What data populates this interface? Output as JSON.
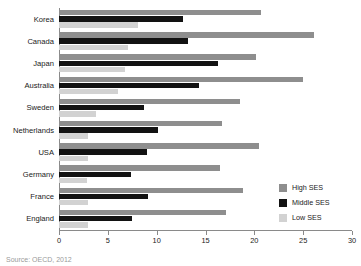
{
  "chart_data": {
    "type": "bar",
    "orientation": "horizontal",
    "title": "",
    "xlabel": "",
    "ylabel": "",
    "xlim": [
      0,
      30
    ],
    "xticks": [
      0,
      5,
      10,
      15,
      20,
      25,
      30
    ],
    "grid": false,
    "legend_position": "right",
    "categories": [
      "Korea",
      "Canada",
      "Japan",
      "Australia",
      "Sweden",
      "Netherlands",
      "USA",
      "Germany",
      "France",
      "England"
    ],
    "series": [
      {
        "name": "High SES",
        "color": "#8e8e8e",
        "values": [
          20.7,
          26.1,
          20.2,
          25.0,
          18.5,
          16.7,
          20.5,
          16.5,
          18.8,
          17.1
        ]
      },
      {
        "name": "Middle SES",
        "color": "#121212",
        "values": [
          12.7,
          13.2,
          16.3,
          14.3,
          8.7,
          10.1,
          9.0,
          7.4,
          9.1,
          7.5
        ]
      },
      {
        "name": "Low SES",
        "color": "#d2d2d2",
        "values": [
          8.1,
          7.1,
          6.8,
          6.0,
          3.8,
          3.0,
          3.0,
          2.9,
          3.0,
          3.0
        ]
      }
    ]
  },
  "legend": {
    "items": [
      {
        "label": "High SES",
        "color": "#8e8e8e"
      },
      {
        "label": "Middle SES",
        "color": "#121212"
      },
      {
        "label": "Low SES",
        "color": "#d2d2d2"
      }
    ]
  },
  "source": {
    "text": "Source: OECD, 2012"
  }
}
